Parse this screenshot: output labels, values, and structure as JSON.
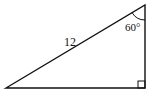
{
  "diagram": {
    "type": "right-triangle",
    "hypotenuse_label": "12",
    "angle_label": "60°",
    "right_angle_marker": true,
    "stroke_color": "#111111",
    "background": "#ffffff"
  }
}
